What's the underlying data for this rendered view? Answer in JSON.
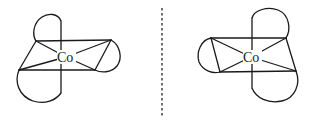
{
  "diagram": {
    "title": "",
    "type": "enantiomers-of-octahedral-complex",
    "molecules": [
      {
        "id": "left",
        "metal_label": "Co",
        "metal_position": [
          66,
          57
        ],
        "description": "Octahedral Co complex with three bidentate (chelate) ligands"
      },
      {
        "id": "right",
        "metal_label": "Co",
        "metal_position": [
          251,
          57
        ],
        "description": "Mirror image of the left Co complex"
      }
    ],
    "mirror_plane": {
      "style": "dashed",
      "x": 162
    }
  }
}
